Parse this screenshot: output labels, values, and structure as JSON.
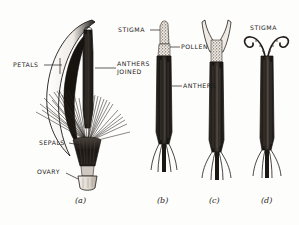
{
  "figure": {
    "background_color": "#fdfdfc",
    "ink_color": "#1d1b19",
    "caption_style": "italic"
  },
  "labels": {
    "petals": "PETALS",
    "anthers_joined_line1": "ANTHERS",
    "anthers_joined_line2": "JOINED",
    "sepals": "SEPALS",
    "ovary": "OVARY",
    "stigma_b": "STIGMA",
    "pollen": "POLLEN",
    "anthers": "ANTHERS",
    "stigma_d": "STIGMA"
  },
  "panels": [
    {
      "id": "a",
      "caption": "(a)",
      "description": "whole floret with crescent petal, joined anther column, sepal bristles and ovary"
    },
    {
      "id": "b",
      "caption": "(b)",
      "description": "style with stigma tip and pollen on anther tube"
    },
    {
      "id": "c",
      "caption": "(c)",
      "description": "style with forked Y-shaped stigma emerging from anther tube"
    },
    {
      "id": "d",
      "caption": "(d)",
      "description": "style with two outward-curled stigma lobes"
    }
  ]
}
